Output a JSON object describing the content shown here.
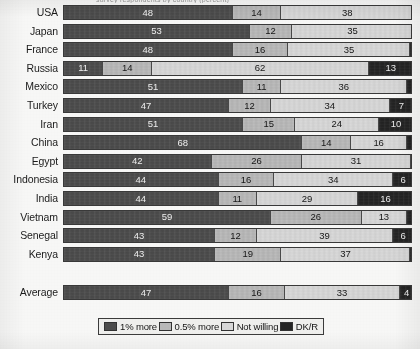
{
  "title_cutoff": "survey respondents by country (percent)",
  "chart_data": {
    "type": "bar",
    "orientation": "horizontal",
    "stacked": true,
    "normalized_percent": true,
    "title": "",
    "xlabel": "",
    "ylabel": "",
    "xlim": [
      0,
      100
    ],
    "grid": false,
    "legend_position": "bottom",
    "categories": [
      "USA",
      "Japan",
      "France",
      "Russia",
      "Mexico",
      "Turkey",
      "Iran",
      "China",
      "Egypt",
      "Indonesia",
      "India",
      "Vietnam",
      "Senegal",
      "Kenya",
      "Average"
    ],
    "series": [
      {
        "name": "1% more",
        "color": "#4d4d4d",
        "values": [
          48,
          53,
          48,
          11,
          51,
          47,
          51,
          68,
          42,
          44,
          44,
          59,
          43,
          43,
          47
        ]
      },
      {
        "name": "0.5% more",
        "color": "#bcbcbc",
        "values": [
          14,
          12,
          16,
          14,
          11,
          12,
          15,
          14,
          26,
          16,
          11,
          26,
          12,
          19,
          16
        ]
      },
      {
        "name": "Not willing",
        "color": "#dcdcdc",
        "values": [
          38,
          35,
          35,
          62,
          36,
          34,
          24,
          16,
          31,
          34,
          29,
          13,
          39,
          37,
          33
        ]
      },
      {
        "name": "DK/R",
        "color": "#242424",
        "values": [
          0,
          0,
          1,
          13,
          2,
          7,
          10,
          2,
          1,
          6,
          16,
          2,
          6,
          1,
          4
        ]
      }
    ]
  },
  "rows": [
    {
      "label": "USA",
      "values": [
        48,
        14,
        38,
        0
      ]
    },
    {
      "label": "Japan",
      "values": [
        53,
        12,
        35,
        0
      ]
    },
    {
      "label": "France",
      "values": [
        48,
        16,
        35,
        1
      ]
    },
    {
      "label": "Russia",
      "values": [
        11,
        14,
        62,
        13
      ]
    },
    {
      "label": "Mexico",
      "values": [
        51,
        11,
        36,
        2
      ]
    },
    {
      "label": "Turkey",
      "values": [
        47,
        12,
        34,
        7
      ]
    },
    {
      "label": "Iran",
      "values": [
        51,
        15,
        24,
        10
      ]
    },
    {
      "label": "China",
      "values": [
        68,
        14,
        16,
        2
      ]
    },
    {
      "label": "Egypt",
      "values": [
        42,
        26,
        31,
        1
      ]
    },
    {
      "label": "Indonesia",
      "values": [
        44,
        16,
        34,
        6
      ]
    },
    {
      "label": "India",
      "values": [
        44,
        11,
        29,
        16
      ]
    },
    {
      "label": "Vietnam",
      "values": [
        59,
        26,
        13,
        2
      ]
    },
    {
      "label": "Senegal",
      "values": [
        43,
        12,
        39,
        6
      ]
    },
    {
      "label": "Kenya",
      "values": [
        43,
        19,
        37,
        1
      ]
    }
  ],
  "average_row": {
    "label": "Average",
    "values": [
      47,
      16,
      33,
      4
    ]
  },
  "legend": {
    "items": [
      {
        "label": "1% more",
        "color": "#4d4d4d"
      },
      {
        "label": "0.5% more",
        "color": "#bcbcbc"
      },
      {
        "label": "Not willing",
        "color": "#dcdcdc"
      },
      {
        "label": "DK/R",
        "color": "#242424"
      }
    ]
  }
}
